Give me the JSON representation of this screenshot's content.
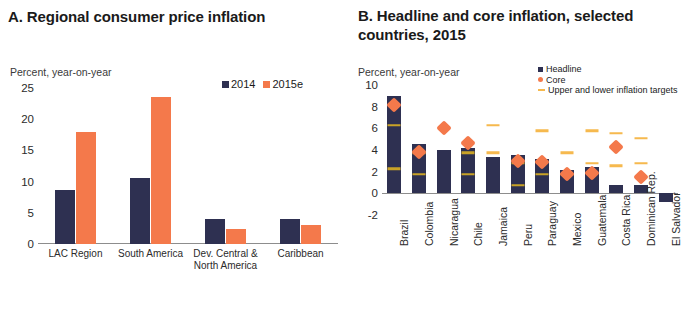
{
  "panel_a": {
    "title": "A. Regional consumer price inflation",
    "axis_note": "Percent, year-on-year",
    "legend": [
      {
        "label": "2014",
        "color": "#2e3051"
      },
      {
        "label": "2015e",
        "color": "#f4794b"
      }
    ],
    "chart_data": {
      "type": "bar",
      "title": "A. Regional consumer price inflation",
      "ylabel": "Percent, year-on-year",
      "xlabel": "",
      "ylim": [
        0,
        25
      ],
      "yticks": [
        0,
        5,
        10,
        15,
        20,
        25
      ],
      "grid": false,
      "legend_position": "top-right",
      "categories": [
        "LAC Region",
        "South America",
        "Dev. Central & North America",
        "Caribbean"
      ],
      "series": [
        {
          "name": "2014",
          "color": "#2e3051",
          "values": [
            8.7,
            10.5,
            4.0,
            4.0
          ]
        },
        {
          "name": "2015e",
          "color": "#f4794b",
          "values": [
            18.0,
            23.5,
            2.4,
            3.0
          ]
        }
      ]
    }
  },
  "panel_b": {
    "title": "B. Headline and core inflation, selected countries, 2015",
    "axis_note": "Percent, year-on-year",
    "legend": [
      {
        "label": "Headline",
        "color": "#2e3051",
        "marker": "square"
      },
      {
        "label": "Core",
        "color": "#f4794b",
        "marker": "dot"
      },
      {
        "label": "Upper and lower inflation targets",
        "color": "#f6b94e",
        "marker": "dash"
      }
    ],
    "chart_data": {
      "type": "bar",
      "title": "B. Headline and core inflation, selected countries, 2015",
      "ylabel": "Percent, year-on-year",
      "xlabel": "",
      "ylim": [
        -2,
        10
      ],
      "yticks": [
        -2,
        0,
        2,
        4,
        6,
        8,
        10
      ],
      "grid": false,
      "legend_position": "top-right",
      "categories": [
        "Brazil",
        "Colombia",
        "Nicaragua",
        "Chile",
        "Jamaica",
        "Peru",
        "Paraguay",
        "Mexico",
        "Guatemala",
        "Costa Rica",
        "Dominican Rep.",
        "El Salvador"
      ],
      "series": [
        {
          "name": "Headline",
          "color": "#2e3051",
          "values": [
            9.0,
            4.6,
            4.0,
            4.2,
            3.4,
            3.5,
            3.2,
            2.2,
            2.4,
            0.8,
            0.8,
            -0.8
          ]
        },
        {
          "name": "Core",
          "color": "#f4794b",
          "values": [
            8.7,
            4.3,
            6.5,
            5.2,
            null,
            3.5,
            3.4,
            2.3,
            2.4,
            4.8,
            2.0,
            null
          ]
        },
        {
          "name": "Upper inflation target",
          "color": "#f6b94e",
          "values": [
            6.5,
            4.0,
            null,
            4.0,
            6.5,
            3.0,
            6.0,
            4.0,
            6.0,
            5.8,
            5.3,
            null
          ]
        },
        {
          "name": "Lower inflation target",
          "color": "#f6b94e",
          "values": [
            2.5,
            2.0,
            null,
            2.0,
            4.0,
            1.0,
            2.0,
            2.0,
            3.0,
            2.8,
            3.0,
            null
          ]
        }
      ]
    }
  }
}
